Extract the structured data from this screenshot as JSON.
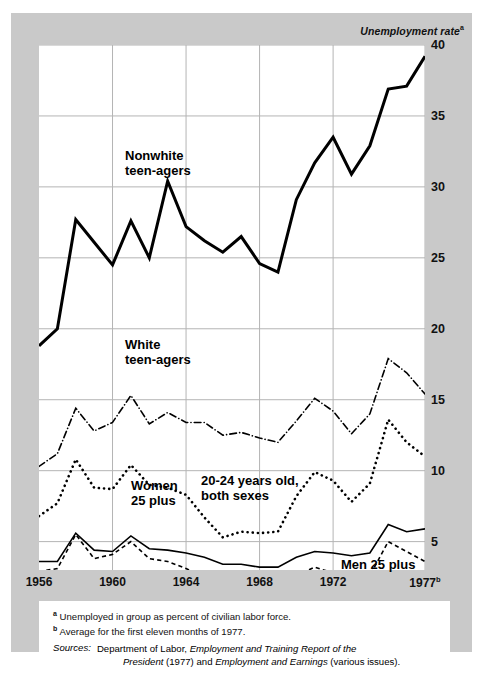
{
  "axis_title": "Unemployment rate",
  "axis_title_marker": "a",
  "footnotes": {
    "a_marker": "a",
    "a_text": "Unemployed in group as percent of civilian labor force.",
    "b_marker": "b",
    "b_text": "Average for the first eleven months of 1977.",
    "sources_label": "Sources:",
    "sources_line1_pre": "Department of Labor, ",
    "sources_line1_italic": "Employment and Training Report of the",
    "sources_line2_italic_a": "President",
    "sources_line2_mid": " (1977) and ",
    "sources_line2_italic_b": "Employment and Earnings",
    "sources_line2_post": " (various issues)."
  },
  "chart_data": {
    "type": "line",
    "title": "",
    "xlabel": "",
    "ylabel": "Unemployment rate",
    "xlim": [
      1956,
      1977
    ],
    "ylim": [
      3.0,
      40.0
    ],
    "grid": true,
    "legend_position": "inline-annotations",
    "ytick_values": [
      5,
      10,
      15,
      20,
      25,
      30,
      35,
      40
    ],
    "ytick_labels": [
      "5",
      "10",
      "15",
      "20",
      "25",
      "30",
      "35",
      "40"
    ],
    "xtick_values": [
      1956,
      1960,
      1964,
      1968,
      1972,
      1977
    ],
    "xtick_labels": [
      "1956",
      "1960",
      "1964",
      "1968",
      "1972",
      "1977"
    ],
    "xtick_last_marker": "b",
    "gridline_years": [
      1960,
      1964,
      1968,
      1972,
      1977
    ],
    "x": [
      1956,
      1957,
      1958,
      1959,
      1960,
      1961,
      1962,
      1963,
      1964,
      1965,
      1966,
      1967,
      1968,
      1969,
      1970,
      1971,
      1972,
      1973,
      1974,
      1975,
      1976,
      1977
    ],
    "series": [
      {
        "name": "Nonwhite teen-agers",
        "style": "solid",
        "width": 3.0,
        "color": "#000000",
        "label_text_line1": "Nonwhite",
        "label_text_line2": "teen-agers",
        "values": [
          18.8,
          20.0,
          27.7,
          26.1,
          24.5,
          27.6,
          25.0,
          30.4,
          27.2,
          26.2,
          25.4,
          26.5,
          24.6,
          24.0,
          29.1,
          31.7,
          33.5,
          30.9,
          32.9,
          36.9,
          37.1,
          39.2
        ]
      },
      {
        "name": "White teen-agers",
        "style": "dashdot",
        "width": 1.6,
        "color": "#000000",
        "label_text_line1": "White",
        "label_text_line2": "teen-agers",
        "values": [
          10.3,
          11.2,
          14.4,
          12.8,
          13.4,
          15.3,
          13.3,
          14.1,
          13.4,
          13.4,
          12.5,
          12.7,
          12.3,
          12.0,
          13.5,
          15.1,
          14.2,
          12.6,
          14.0,
          17.9,
          16.9,
          15.4
        ]
      },
      {
        "name": "20-24 years old, both sexes",
        "style": "dotted",
        "width": 2.6,
        "color": "#000000",
        "label_text_line1": "20-24 years old,",
        "label_text_line2": "both sexes",
        "values": [
          6.8,
          7.7,
          10.8,
          8.8,
          8.7,
          10.4,
          9.0,
          8.8,
          8.3,
          6.7,
          5.3,
          5.7,
          5.6,
          5.7,
          8.2,
          9.9,
          9.3,
          7.8,
          9.1,
          13.6,
          12.0,
          11.0
        ]
      },
      {
        "name": "Women 25 plus",
        "style": "solid",
        "width": 1.6,
        "color": "#000000",
        "label_text_line1": "Women",
        "label_text_line2": "25 plus",
        "values": [
          3.6,
          3.6,
          5.6,
          4.4,
          4.3,
          5.4,
          4.5,
          4.4,
          4.2,
          3.9,
          3.4,
          3.4,
          3.2,
          3.2,
          3.9,
          4.3,
          4.2,
          4.0,
          4.2,
          6.2,
          5.7,
          5.9
        ]
      },
      {
        "name": "Men 25 plus",
        "style": "dashed",
        "width": 1.6,
        "color": "#000000",
        "label_text_line1": "Men 25 plus",
        "values": [
          2.9,
          3.1,
          5.5,
          3.8,
          4.1,
          5.0,
          3.8,
          3.6,
          3.1,
          2.5,
          2.0,
          1.9,
          1.8,
          1.7,
          2.6,
          3.2,
          2.8,
          2.3,
          2.6,
          5.0,
          4.3,
          3.6
        ]
      }
    ]
  }
}
